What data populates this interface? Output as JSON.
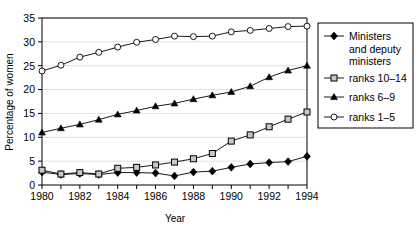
{
  "chart_data": {
    "type": "line",
    "title": "",
    "xlabel": "Year",
    "ylabel": "Percentage of women",
    "xlim": [
      1980,
      1994
    ],
    "ylim": [
      0,
      35
    ],
    "yticks": [
      0,
      5,
      10,
      15,
      20,
      25,
      30,
      35
    ],
    "xticks": [
      1980,
      1981,
      1982,
      1983,
      1984,
      1985,
      1986,
      1987,
      1988,
      1989,
      1990,
      1991,
      1992,
      1993,
      1994
    ],
    "xtick_labels": [
      "1980",
      "",
      "1982",
      "",
      "1984",
      "",
      "1986",
      "",
      "1988",
      "",
      "1990",
      "",
      "1992",
      "",
      "1994"
    ],
    "grid": "horizontal",
    "legend_position": "right",
    "x": [
      1980,
      1981,
      1982,
      1983,
      1984,
      1985,
      1986,
      1987,
      1988,
      1989,
      1990,
      1991,
      1992,
      1993,
      1994
    ],
    "series": [
      {
        "name": "Ministers and deputy ministers",
        "marker": "filled-diamond",
        "values": [
          2.7,
          2.2,
          2.4,
          2.2,
          2.6,
          2.6,
          2.5,
          1.9,
          2.7,
          2.9,
          3.7,
          4.4,
          4.7,
          4.9,
          6.0
        ]
      },
      {
        "name": "ranks 10–14",
        "marker": "open-square",
        "values": [
          3.1,
          2.3,
          2.6,
          2.3,
          3.5,
          3.7,
          4.2,
          4.8,
          5.5,
          6.6,
          9.2,
          10.5,
          12.2,
          13.8,
          15.3
        ]
      },
      {
        "name": "ranks 6–9",
        "marker": "filled-triangle",
        "values": [
          11.0,
          11.9,
          12.7,
          13.7,
          14.8,
          15.6,
          16.5,
          17.1,
          18.0,
          18.8,
          19.5,
          20.7,
          22.6,
          24.0,
          25.0
        ]
      },
      {
        "name": "ranks 1–5",
        "marker": "open-circle",
        "values": [
          23.9,
          25.1,
          26.8,
          27.8,
          28.9,
          29.9,
          30.5,
          31.2,
          31.1,
          31.2,
          32.1,
          32.4,
          32.8,
          33.2,
          33.3
        ]
      }
    ]
  },
  "axes": {
    "ylabel": "Percentage of women",
    "xlabel": "Year",
    "ytick_labels": [
      "0",
      "5",
      "10",
      "15",
      "20",
      "25",
      "30",
      "35"
    ],
    "xtick_labels": [
      "1980",
      "1982",
      "1984",
      "1986",
      "1988",
      "1990",
      "1992",
      "1994"
    ]
  },
  "legend": {
    "entries": [
      {
        "label_line1": "Ministers",
        "label_line2": "and deputy",
        "label_line3": "ministers",
        "marker": "filled-diamond"
      },
      {
        "label_line1": "ranks 10–14",
        "marker": "open-square"
      },
      {
        "label_line1": "ranks 6–9",
        "marker": "filled-triangle"
      },
      {
        "label_line1": "ranks 1–5",
        "marker": "open-circle"
      }
    ]
  },
  "colors": {
    "line": "#000000",
    "marker_fill_open": "#ffffff",
    "marker_fill_square": "#c8c8c8",
    "grid": "#d9d9d9",
    "background": "#ffffff"
  }
}
